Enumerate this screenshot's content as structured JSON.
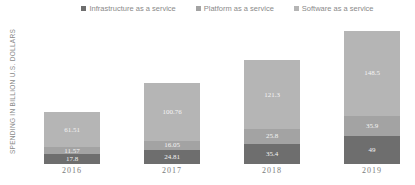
{
  "chart_data": {
    "type": "bar",
    "stacked": true,
    "title": "",
    "xlabel": "",
    "ylabel": "SPENDING IN BILLION U.S. DOLLARS",
    "categories": [
      "2016",
      "2017",
      "2018",
      "2019"
    ],
    "series": [
      {
        "name": "Infrastructure as a service",
        "color": "#6e6e6e",
        "values": [
          17.8,
          24.81,
          35.4,
          49
        ],
        "labels": [
          "17.8",
          "24.81",
          "35.4",
          "49"
        ]
      },
      {
        "name": "Platform as a service",
        "color": "#a3a3a3",
        "values": [
          11.57,
          16.05,
          25.8,
          35.9
        ],
        "labels": [
          "11.57",
          "16.05",
          "25.8",
          "35.9"
        ]
      },
      {
        "name": "Software as a service",
        "color": "#b5b5b5",
        "values": [
          61.51,
          100.76,
          121.3,
          148.5
        ],
        "labels": [
          "61.51",
          "100.76",
          "121.3",
          "148.5"
        ]
      }
    ],
    "legend_position": "top",
    "grid": false
  },
  "legend": [
    {
      "label": "Infrastructure as a service",
      "color": "#6e6e6e"
    },
    {
      "label": "Platform as a service",
      "color": "#a3a3a3"
    },
    {
      "label": "Software as a service",
      "color": "#b5b5b5"
    }
  ],
  "axis": {
    "ylabel": "SPENDING IN BILLION U.S. DOLLARS"
  }
}
